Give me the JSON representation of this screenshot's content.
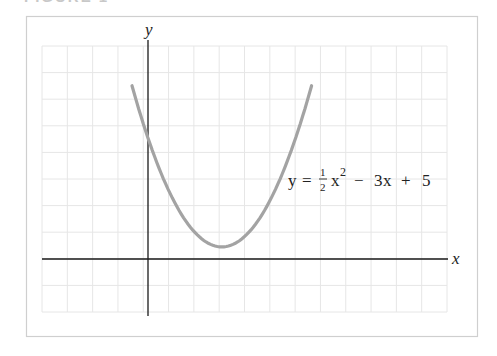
{
  "figure": {
    "label": "FIGURE 1"
  },
  "chart_data": {
    "type": "line",
    "title": "",
    "xlabel": "x",
    "ylabel": "y",
    "equation_label": {
      "y": "y",
      "eq": "=",
      "frac_num": "1",
      "frac_den": "2",
      "x": "x",
      "exp": "2",
      "rest_minus": "−",
      "rest_3x": "3",
      "rest_x": "x",
      "rest_plus": "+",
      "rest_5": "5"
    },
    "series": [
      {
        "name": "y = 1/2 x^2 - 3x + 5",
        "function": "0.5*x^2 - 3*x + 5",
        "x": [
          -0.65,
          0,
          1,
          2,
          3,
          4,
          5,
          6,
          6.65
        ],
        "values": [
          7.16,
          5,
          2.5,
          1,
          0.5,
          1,
          2.5,
          5,
          7.16
        ],
        "color": "#a3a3a3"
      }
    ],
    "xlim": [
      -4.3,
      12.1
    ],
    "ylim": [
      -2.1,
      8.5
    ],
    "grid": true,
    "legend": "none",
    "colors": {
      "grid": "#e6e6e6",
      "axis": "#1a1a1a",
      "frame": "#cfcfcf",
      "curve": "#a3a3a3"
    }
  }
}
